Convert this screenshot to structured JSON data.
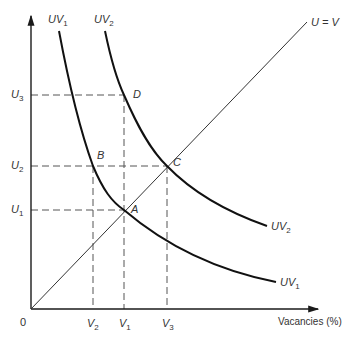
{
  "diagram": {
    "axes": {
      "x_label": "Vacancies (%)",
      "y_label": "Unemployment",
      "origin_label": "0"
    },
    "line_45": {
      "label": "U = V"
    },
    "curves": [
      {
        "id": "UV1",
        "label_main": "UV",
        "label_sub": "1"
      },
      {
        "id": "UV2",
        "label_main": "UV",
        "label_sub": "2"
      }
    ],
    "points": [
      {
        "id": "A",
        "label": "A"
      },
      {
        "id": "B",
        "label": "B"
      },
      {
        "id": "C",
        "label": "C"
      },
      {
        "id": "D",
        "label": "D"
      }
    ],
    "y_ticks": [
      {
        "main": "U",
        "sub": "3"
      },
      {
        "main": "U",
        "sub": "2"
      },
      {
        "main": "U",
        "sub": "1"
      }
    ],
    "x_ticks": [
      {
        "main": "V",
        "sub": "2"
      },
      {
        "main": "V",
        "sub": "1"
      },
      {
        "main": "V",
        "sub": "3"
      }
    ],
    "colors": {
      "ink": "#1a1a1a",
      "dash": "#555555"
    }
  }
}
